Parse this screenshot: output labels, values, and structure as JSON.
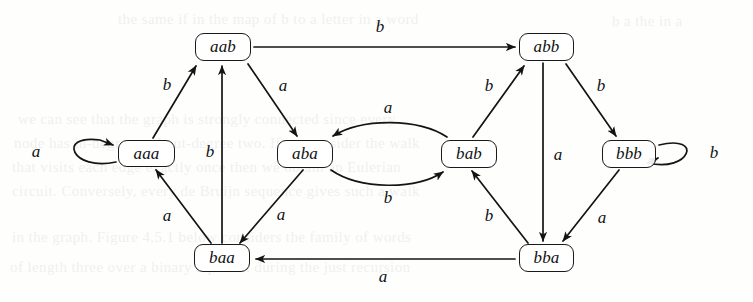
{
  "figure": {
    "type": "directed-graph",
    "background_color": "#fefefd",
    "ink_color": "#111111",
    "width": 753,
    "height": 302
  },
  "nodes": [
    {
      "id": "aaa",
      "label": "aaa",
      "x": 118,
      "y": 140,
      "w": 57,
      "h": 27
    },
    {
      "id": "aab",
      "label": "aab",
      "x": 195,
      "y": 33,
      "w": 56,
      "h": 28
    },
    {
      "id": "aba",
      "label": "aba",
      "x": 277,
      "y": 140,
      "w": 56,
      "h": 28
    },
    {
      "id": "abb",
      "label": "abb",
      "x": 519,
      "y": 33,
      "w": 55,
      "h": 28
    },
    {
      "id": "bab",
      "label": "bab",
      "x": 441,
      "y": 140,
      "w": 56,
      "h": 28
    },
    {
      "id": "baa",
      "label": "baa",
      "x": 194,
      "y": 244,
      "w": 56,
      "h": 28
    },
    {
      "id": "bba",
      "label": "bba",
      "x": 519,
      "y": 244,
      "w": 55,
      "h": 28
    },
    {
      "id": "bbb",
      "label": "bbb",
      "x": 602,
      "y": 140,
      "w": 54,
      "h": 28
    }
  ],
  "edges": [
    {
      "id": "aaa-aaa",
      "from": "aaa",
      "to": "aaa",
      "label": "a",
      "kind": "self-loop-left",
      "label_x": 36,
      "label_y": 152
    },
    {
      "id": "aaa-aab",
      "from": "aaa",
      "to": "aab",
      "label": "b",
      "kind": "straight",
      "label_x": 167,
      "label_y": 85
    },
    {
      "id": "aab-abb",
      "from": "aab",
      "to": "abb",
      "label": "b",
      "kind": "straight",
      "label_x": 380,
      "label_y": 27
    },
    {
      "id": "aab-aba",
      "from": "aab",
      "to": "aba",
      "label": "a",
      "kind": "straight",
      "label_x": 283,
      "label_y": 86
    },
    {
      "id": "aba-bab",
      "from": "aba",
      "to": "bab",
      "label": "b",
      "kind": "curve-down",
      "label_x": 388,
      "label_y": 198
    },
    {
      "id": "bab-aba",
      "from": "bab",
      "to": "aba",
      "label": "a",
      "kind": "curve-up",
      "label_x": 388,
      "label_y": 108
    },
    {
      "id": "aba-baa",
      "from": "aba",
      "to": "baa",
      "label": "a",
      "kind": "straight",
      "label_x": 281,
      "label_y": 215
    },
    {
      "id": "baa-aaa",
      "from": "baa",
      "to": "aaa",
      "label": "a",
      "kind": "straight",
      "label_x": 167,
      "label_y": 216
    },
    {
      "id": "baa-aab",
      "from": "baa",
      "to": "aab",
      "label": "b",
      "kind": "straight",
      "label_x": 210,
      "label_y": 152
    },
    {
      "id": "bab-abb",
      "from": "bab",
      "to": "abb",
      "label": "b",
      "kind": "straight",
      "label_x": 489,
      "label_y": 86
    },
    {
      "id": "abb-bbb",
      "from": "abb",
      "to": "bbb",
      "label": "b",
      "kind": "straight",
      "label_x": 601,
      "label_y": 86
    },
    {
      "id": "abb-bba",
      "from": "abb",
      "to": "bba",
      "label": "a",
      "kind": "straight",
      "label_x": 558,
      "label_y": 155
    },
    {
      "id": "bbb-bbb",
      "from": "bbb",
      "to": "bbb",
      "label": "b",
      "kind": "self-loop-right",
      "label_x": 714,
      "label_y": 153
    },
    {
      "id": "bbb-bba",
      "from": "bbb",
      "to": "bba",
      "label": "a",
      "kind": "straight",
      "label_x": 602,
      "label_y": 218
    },
    {
      "id": "bba-bab",
      "from": "bba",
      "to": "bab",
      "label": "b",
      "kind": "straight",
      "label_x": 489,
      "label_y": 216
    },
    {
      "id": "bba-baa",
      "from": "bba",
      "to": "baa",
      "label": "a",
      "kind": "straight",
      "label_x": 383,
      "label_y": 277
    }
  ],
  "ghost_text": [
    {
      "text": "the  same  if  in  the  map  of  b  to  a  letter  in  a  word",
      "x": 118,
      "y": 4
    },
    {
      "text": "we  can  see  that  the  graph  is  strongly  connected  since  every",
      "x": 18,
      "y": 104
    },
    {
      "text": "node  has  in-degree  and  out-degree  two.  If  we  consider  the  walk",
      "x": 14,
      "y": 128
    },
    {
      "text": "that  visits  each  edge  exactly  once  then  we  obtain  an  Eulerian",
      "x": 12,
      "y": 152
    },
    {
      "text": "circuit.  Conversely,  every  de  Bruijn  sequence  gives  such  a  walk",
      "x": 12,
      "y": 176
    },
    {
      "text": "in  the  graph.  Figure  4.5.1  below  considers  the  family  of  words",
      "x": 12,
      "y": 222
    },
    {
      "text": "of  length  three  over  a  binary  alphabet  during  the  just  recursion",
      "x": 10,
      "y": 252
    },
    {
      "text": "b        a        the        in        a",
      "x": 612,
      "y": 6
    }
  ]
}
